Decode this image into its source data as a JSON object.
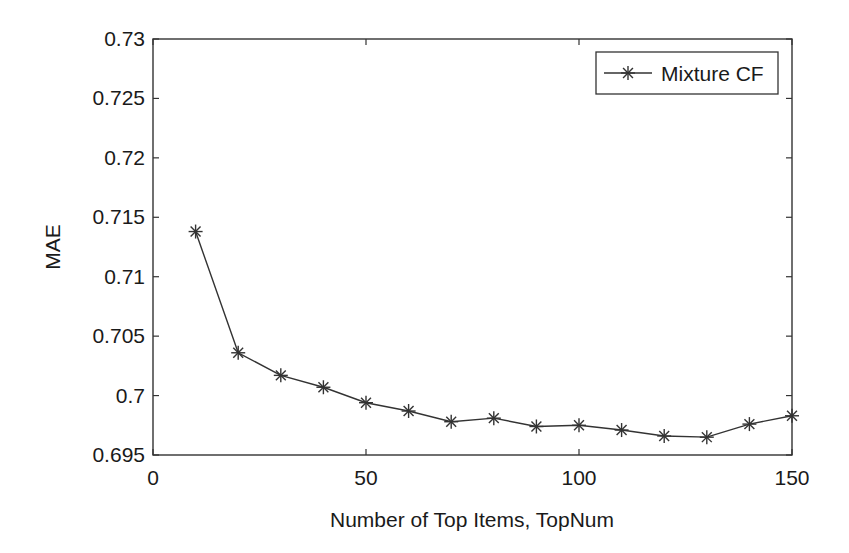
{
  "chart_data": {
    "type": "line",
    "title": "",
    "xlabel": "Number of Top Items, TopNum",
    "ylabel": "MAE",
    "xlim": [
      0,
      150
    ],
    "ylim": [
      0.695,
      0.73
    ],
    "x_ticks": [
      "0",
      "50",
      "100",
      "150"
    ],
    "y_ticks": [
      "0.695",
      "0.7",
      "0.705",
      "0.71",
      "0.715",
      "0.72",
      "0.725",
      "0.73"
    ],
    "grid": false,
    "legend_position": "upper right",
    "x": [
      10,
      20,
      30,
      40,
      50,
      60,
      70,
      80,
      90,
      100,
      110,
      120,
      130,
      140,
      150
    ],
    "series": [
      {
        "name": "Mixture CF",
        "marker": "asterisk",
        "color": "#333333",
        "values": [
          0.7138,
          0.7036,
          0.7017,
          0.7007,
          0.6994,
          0.6987,
          0.6978,
          0.6981,
          0.6974,
          0.6975,
          0.6971,
          0.6966,
          0.6965,
          0.6976,
          0.6983
        ]
      }
    ]
  }
}
